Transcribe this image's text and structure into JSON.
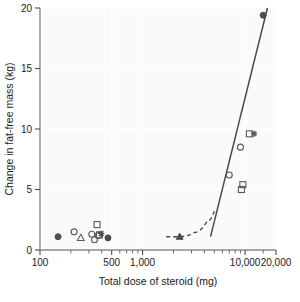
{
  "chart_data": {
    "type": "scatter",
    "title": "",
    "xlabel": "Total dose of steroid (mg)",
    "ylabel": "Change in fat-free mass (kg)",
    "xscale": "log",
    "yscale": "linear",
    "xlim": [
      100,
      20000
    ],
    "ylim": [
      0,
      20
    ],
    "grid": true,
    "legend": "none",
    "xticks": [
      100,
      500,
      1000,
      10000,
      20000
    ],
    "xtick_labels": [
      "100",
      "500",
      "1,000",
      "10,000",
      "20,000"
    ],
    "xticks_minor": [
      200,
      300,
      400,
      600,
      700,
      800,
      900,
      2000,
      3000,
      4000,
      5000,
      6000,
      7000,
      8000,
      9000,
      15000
    ],
    "yticks": [
      0,
      5,
      10,
      15,
      20
    ],
    "ytick_labels": [
      "0",
      "5",
      "10",
      "15",
      "20"
    ],
    "series": [
      {
        "name": "filled-circle",
        "marker": "filled-circle",
        "points": [
          {
            "x": 150,
            "y": 1.1
          },
          {
            "x": 460,
            "y": 1.0
          },
          {
            "x": 15000,
            "y": 19.4
          }
        ]
      },
      {
        "name": "open-circle",
        "marker": "open-circle",
        "points": [
          {
            "x": 215,
            "y": 1.5
          },
          {
            "x": 320,
            "y": 1.3
          },
          {
            "x": 340,
            "y": 0.85
          },
          {
            "x": 370,
            "y": 1.2
          },
          {
            "x": 7000,
            "y": 6.2
          },
          {
            "x": 9000,
            "y": 8.5
          }
        ]
      },
      {
        "name": "open-triangle",
        "marker": "open-triangle",
        "points": [
          {
            "x": 250,
            "y": 1.0
          }
        ]
      },
      {
        "name": "open-square",
        "marker": "open-square",
        "points": [
          {
            "x": 360,
            "y": 2.1
          },
          {
            "x": 380,
            "y": 1.25
          },
          {
            "x": 9500,
            "y": 5.4
          },
          {
            "x": 9200,
            "y": 5.0
          },
          {
            "x": 11000,
            "y": 9.6
          }
        ]
      },
      {
        "name": "plus-star",
        "marker": "plus",
        "points": [
          {
            "x": 395,
            "y": 1.35
          },
          {
            "x": 12200,
            "y": 9.6
          }
        ]
      },
      {
        "name": "filled-triangle",
        "marker": "filled-triangle",
        "points": [
          {
            "x": 2300,
            "y": 1.1
          }
        ]
      }
    ],
    "fit_line": {
      "style": "solid",
      "points": [
        {
          "x": 4600,
          "y": 1.1
        },
        {
          "x": 16500,
          "y": 20.0
        }
      ]
    },
    "trend_curve": {
      "style": "dashed",
      "points": [
        {
          "x": 1700,
          "y": 1.1
        },
        {
          "x": 2300,
          "y": 1.1
        },
        {
          "x": 3200,
          "y": 1.45
        },
        {
          "x": 4200,
          "y": 2.3
        },
        {
          "x": 5000,
          "y": 3.2
        }
      ]
    }
  }
}
